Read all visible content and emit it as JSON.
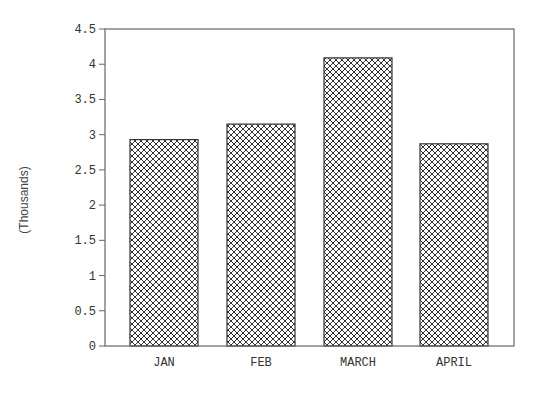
{
  "chart_data": {
    "type": "bar",
    "title": "",
    "xlabel": "",
    "ylabel": "(Thousands)",
    "categories": [
      "JAN",
      "FEB",
      "MARCH",
      "APRIL"
    ],
    "values": [
      2.93,
      3.15,
      4.09,
      2.87
    ],
    "ylim": [
      0,
      4.5
    ],
    "yticks": [
      "0",
      "0.5",
      "1",
      "1.5",
      "2",
      "2.5",
      "3",
      "3.5",
      "4",
      "4.5"
    ],
    "grid": false,
    "legend": null,
    "bar_fill": "crosshatch",
    "colors": {
      "bar_stroke": "#333333",
      "axis": "#555555",
      "text": "#333333"
    }
  }
}
